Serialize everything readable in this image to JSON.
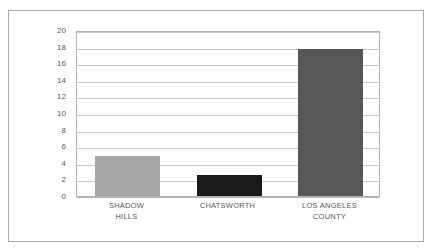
{
  "chart_data": {
    "type": "bar",
    "title": "",
    "subtitle": "",
    "xlabel": "",
    "ylabel": "",
    "categories": [
      "SHADOW\nHILLS",
      "CHATSWORTH",
      "LOS ANGELES\nCOUNTY"
    ],
    "values": [
      4.8,
      2.5,
      17.7
    ],
    "series": [
      {
        "name": "",
        "values": [
          4.8,
          2.5,
          17.7
        ]
      }
    ],
    "bar_colors": [
      "#a6a6a6",
      "#1a1a1a",
      "#575757"
    ],
    "ylim": [
      0,
      20
    ],
    "ytick_labels": [
      "0",
      "2",
      "4",
      "6",
      "8",
      "10",
      "12",
      "14",
      "16",
      "18",
      "20"
    ],
    "ytick_values": [
      0,
      2,
      4,
      6,
      8,
      10,
      12,
      14,
      16,
      18,
      20
    ],
    "grid": true,
    "grid_axis": "y",
    "grid_color": "#c8c8c8",
    "legend": false,
    "legend_position": "none",
    "plot_border_color": "#b4b4b4",
    "frame_color": "#a8a8a8",
    "background_color": "#ffffff",
    "tick_label_color": "#58585a",
    "annotations": []
  }
}
